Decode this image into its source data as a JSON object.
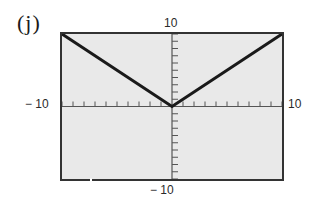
{
  "panel": {
    "label": "(j)"
  },
  "window": {
    "ymax_label": "10",
    "xmin_label": "− 10",
    "xmax_label": "10",
    "ymin_label": "− 10"
  },
  "colors": {
    "screen_background": "#e9e9e9",
    "frame": "#333333",
    "axes": "#555555",
    "curve": "#1a1a1a"
  },
  "chart_data": {
    "type": "line",
    "title": "(j)",
    "xlabel": "",
    "ylabel": "",
    "xlim": [
      -10,
      10
    ],
    "ylim": [
      -10,
      10
    ],
    "xscale_ticks": 1,
    "yscale_ticks": 1,
    "tick_labels": {
      "x": [
        "-10",
        "10"
      ],
      "y": [
        "-10",
        "10"
      ]
    },
    "grid": false,
    "legend": null,
    "series": [
      {
        "name": "y = |x|",
        "x": [
          -10,
          0,
          10
        ],
        "y": [
          10,
          0,
          10
        ]
      }
    ]
  }
}
